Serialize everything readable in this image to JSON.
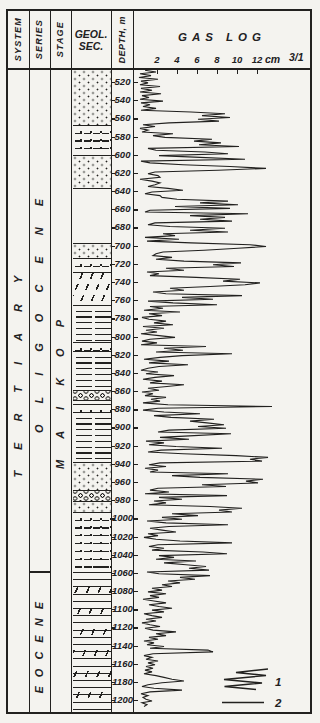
{
  "header": {
    "system_label": "SYSTEM",
    "series_label": "SERIES",
    "stage_label": "STAGE",
    "geol_sec_line1": "GEOL.",
    "geol_sec_line2": "SEC.",
    "depth_label": "DEPTH, m",
    "gas_log_title": "GAS LOG",
    "scale_unit": "cm",
    "scale_ratio": "3/1"
  },
  "stratigraphy": {
    "system": "TERTIARY",
    "series": [
      {
        "name": "OLIGOCENE",
        "depth_from": 520,
        "depth_to": 1060
      },
      {
        "name": "EOCENE",
        "depth_from": 1060,
        "depth_to": 1200
      }
    ],
    "stage": "MAIKOP"
  },
  "depth_axis": {
    "min": 520,
    "max": 1200,
    "step": 20,
    "labels": [
      520,
      540,
      560,
      580,
      600,
      620,
      640,
      660,
      680,
      700,
      720,
      740,
      760,
      780,
      800,
      820,
      840,
      860,
      880,
      900,
      920,
      940,
      960,
      980,
      1000,
      1020,
      1040,
      1060,
      1080,
      1100,
      1120,
      1140,
      1160,
      1180,
      1200
    ]
  },
  "gas_scale": {
    "ticks": [
      2,
      4,
      6,
      8,
      10,
      12
    ]
  },
  "lithology_bands": [
    {
      "depth_from": 507,
      "depth_to": 567,
      "pattern": "dots",
      "name": "sand-dots"
    },
    {
      "depth_from": 567,
      "depth_to": 600,
      "pattern": "dotdash",
      "name": "silty-sand"
    },
    {
      "depth_from": 600,
      "depth_to": 637,
      "pattern": "dots",
      "name": "sand-dots"
    },
    {
      "depth_from": 637,
      "depth_to": 697,
      "pattern": "blank",
      "name": "no-core"
    },
    {
      "depth_from": 697,
      "depth_to": 714,
      "pattern": "dots",
      "name": "sand-dots"
    },
    {
      "depth_from": 714,
      "depth_to": 729,
      "pattern": "dotdash",
      "name": "silty-sand"
    },
    {
      "depth_from": 729,
      "depth_to": 765,
      "pattern": "diag",
      "name": "marl-diagonal"
    },
    {
      "depth_from": 765,
      "depth_to": 806,
      "pattern": "hlines",
      "name": "clay-shale"
    },
    {
      "depth_from": 806,
      "depth_to": 816,
      "pattern": "dotdash",
      "name": "silt-interbed"
    },
    {
      "depth_from": 816,
      "depth_to": 859,
      "pattern": "hlines",
      "name": "clay-shale"
    },
    {
      "depth_from": 859,
      "depth_to": 870,
      "pattern": "pebbles",
      "name": "pebble-bed"
    },
    {
      "depth_from": 870,
      "depth_to": 874,
      "pattern": "hlines",
      "name": "clay-shale"
    },
    {
      "depth_from": 874,
      "depth_to": 883,
      "pattern": "dotdash",
      "name": "silt-interbed"
    },
    {
      "depth_from": 883,
      "depth_to": 938,
      "pattern": "hlines",
      "name": "clay-shale"
    },
    {
      "depth_from": 938,
      "depth_to": 969,
      "pattern": "dots",
      "name": "sand-dots"
    },
    {
      "depth_from": 969,
      "depth_to": 981,
      "pattern": "pebbles",
      "name": "pebble-bed"
    },
    {
      "depth_from": 981,
      "depth_to": 993,
      "pattern": "dots",
      "name": "sand-dots"
    },
    {
      "depth_from": 993,
      "depth_to": 1059,
      "pattern": "dotdash",
      "name": "alternating-silt-sand"
    },
    {
      "depth_from": 1059,
      "depth_to": 1213,
      "pattern": "diag2",
      "name": "shale-with-diagonal-partings"
    }
  ],
  "legend": {
    "items": [
      {
        "label": "1",
        "symbol": "zigzag-curve"
      },
      {
        "label": "2",
        "symbol": "straight-line"
      }
    ]
  },
  "chart_data": {
    "type": "line",
    "title": "GAS LOG",
    "xlabel": "gas reading, cm (scale 3/1)",
    "ylabel": "DEPTH, m",
    "xlim": [
      0,
      17
    ],
    "ylim": [
      520,
      1200
    ],
    "x_ticks": [
      2,
      4,
      6,
      8,
      10,
      12
    ],
    "legend_position": "bottom-right",
    "points": [
      [
        507,
        0.8
      ],
      [
        509,
        1.9
      ],
      [
        511,
        0.3
      ],
      [
        513,
        1.4
      ],
      [
        515,
        0.2
      ],
      [
        517,
        2.1
      ],
      [
        519,
        0.4
      ],
      [
        521,
        1.1
      ],
      [
        523,
        0.3
      ],
      [
        525,
        2.3
      ],
      [
        527,
        0.4
      ],
      [
        529,
        1.5
      ],
      [
        531,
        0.3
      ],
      [
        533,
        2.4
      ],
      [
        535,
        0.5
      ],
      [
        537,
        1.2
      ],
      [
        539,
        0.3
      ],
      [
        541,
        2.6
      ],
      [
        543,
        0.4
      ],
      [
        545,
        1.3
      ],
      [
        547,
        0.6
      ],
      [
        549,
        1.9
      ],
      [
        551,
        0.4
      ],
      [
        553,
        5.4
      ],
      [
        555,
        8.8
      ],
      [
        557,
        6.5
      ],
      [
        559,
        9.3
      ],
      [
        561,
        6.1
      ],
      [
        563,
        8.2
      ],
      [
        565,
        3.2
      ],
      [
        567,
        0.6
      ],
      [
        569,
        1.8
      ],
      [
        571,
        0.3
      ],
      [
        573,
        1.1
      ],
      [
        575,
        0.5
      ],
      [
        577,
        3.6
      ],
      [
        579,
        1.6
      ],
      [
        581,
        2.8
      ],
      [
        583,
        7.5
      ],
      [
        585,
        5.7
      ],
      [
        587,
        8.4
      ],
      [
        589,
        6.2
      ],
      [
        591,
        10.2
      ],
      [
        593,
        1.1
      ],
      [
        595,
        1.9
      ],
      [
        597,
        6.8
      ],
      [
        599,
        9.1
      ],
      [
        601,
        2.2
      ],
      [
        603,
        6.3
      ],
      [
        605,
        10.8
      ],
      [
        607,
        0.4
      ],
      [
        609,
        1.3
      ],
      [
        611,
        4.6
      ],
      [
        613,
        9.3
      ],
      [
        615,
        12.9
      ],
      [
        617,
        8.1
      ],
      [
        619,
        1.8
      ],
      [
        621,
        1.1
      ],
      [
        623,
        2.1
      ],
      [
        625,
        2.3
      ],
      [
        627,
        0.3
      ],
      [
        629,
        1.5
      ],
      [
        631,
        2.3
      ],
      [
        633,
        1.8
      ],
      [
        635,
        1.1
      ],
      [
        637,
        3.1
      ],
      [
        639,
        4.6
      ],
      [
        641,
        1.5
      ],
      [
        643,
        0.8
      ],
      [
        645,
        2.3
      ],
      [
        647,
        2.5
      ],
      [
        649,
        4.0
      ],
      [
        651,
        9.1
      ],
      [
        653,
        6.3
      ],
      [
        655,
        10.1
      ],
      [
        657,
        3.8
      ],
      [
        659,
        9.3
      ],
      [
        661,
        1.3
      ],
      [
        663,
        0.8
      ],
      [
        665,
        11.1
      ],
      [
        667,
        5.3
      ],
      [
        669,
        8.8
      ],
      [
        671,
        6.3
      ],
      [
        673,
        9.5
      ],
      [
        675,
        1.8
      ],
      [
        677,
        1.1
      ],
      [
        679,
        3.3
      ],
      [
        681,
        8.8
      ],
      [
        683,
        5.3
      ],
      [
        685,
        9.1
      ],
      [
        687,
        2.6
      ],
      [
        689,
        3.8
      ],
      [
        691,
        0.8
      ],
      [
        693,
        4.2
      ],
      [
        695,
        1.0
      ],
      [
        697,
        5.4
      ],
      [
        699,
        11.3
      ],
      [
        701,
        12.9
      ],
      [
        703,
        10.1
      ],
      [
        705,
        6.7
      ],
      [
        707,
        2.6
      ],
      [
        709,
        1.9
      ],
      [
        711,
        1.6
      ],
      [
        713,
        3.5
      ],
      [
        715,
        1.9
      ],
      [
        717,
        4.7
      ],
      [
        719,
        10.4
      ],
      [
        721,
        7.6
      ],
      [
        723,
        9.7
      ],
      [
        725,
        2.9
      ],
      [
        727,
        4.7
      ],
      [
        729,
        1.0
      ],
      [
        731,
        2.2
      ],
      [
        733,
        1.3
      ],
      [
        735,
        5.9
      ],
      [
        737,
        10.3
      ],
      [
        739,
        8.6
      ],
      [
        741,
        12.3
      ],
      [
        743,
        10.8
      ],
      [
        745,
        7.3
      ],
      [
        747,
        3.3
      ],
      [
        749,
        4.7
      ],
      [
        751,
        1.6
      ],
      [
        753,
        2.9
      ],
      [
        755,
        10.5
      ],
      [
        757,
        4.5
      ],
      [
        759,
        7.6
      ],
      [
        761,
        1.1
      ],
      [
        763,
        3.6
      ],
      [
        765,
        8.0
      ],
      [
        767,
        1.3
      ],
      [
        769,
        2.6
      ],
      [
        771,
        0.7
      ],
      [
        773,
        4.3
      ],
      [
        775,
        1.2
      ],
      [
        777,
        2.5
      ],
      [
        779,
        0.5
      ],
      [
        781,
        1.2
      ],
      [
        783,
        2.9
      ],
      [
        785,
        1.7
      ],
      [
        787,
        3.6
      ],
      [
        789,
        0.6
      ],
      [
        791,
        2.7
      ],
      [
        793,
        0.9
      ],
      [
        795,
        2.0
      ],
      [
        797,
        0.4
      ],
      [
        799,
        2.2
      ],
      [
        801,
        3.8
      ],
      [
        803,
        1.3
      ],
      [
        805,
        0.5
      ],
      [
        807,
        2.0
      ],
      [
        809,
        0.4
      ],
      [
        811,
        6.9
      ],
      [
        813,
        2.7
      ],
      [
        815,
        4.6
      ],
      [
        817,
        1.9
      ],
      [
        819,
        9.5
      ],
      [
        821,
        4.5
      ],
      [
        823,
        2.3
      ],
      [
        825,
        0.7
      ],
      [
        827,
        3.2
      ],
      [
        829,
        1.2
      ],
      [
        831,
        5.1
      ],
      [
        833,
        2.2
      ],
      [
        835,
        1.1
      ],
      [
        837,
        0.4
      ],
      [
        839,
        2.1
      ],
      [
        841,
        0.9
      ],
      [
        843,
        3.7
      ],
      [
        845,
        1.8
      ],
      [
        847,
        0.6
      ],
      [
        849,
        2.5
      ],
      [
        851,
        1.3
      ],
      [
        853,
        4.7
      ],
      [
        855,
        3.0
      ],
      [
        857,
        1.1
      ],
      [
        859,
        2.2
      ],
      [
        861,
        0.5
      ],
      [
        863,
        1.6
      ],
      [
        865,
        0.8
      ],
      [
        867,
        2.9
      ],
      [
        869,
        1.4
      ],
      [
        871,
        2.3
      ],
      [
        873,
        0.6
      ],
      [
        875,
        3.1
      ],
      [
        877,
        13.5
      ],
      [
        879,
        2.1
      ],
      [
        881,
        0.6
      ],
      [
        883,
        2.7
      ],
      [
        885,
        6.3
      ],
      [
        887,
        1.7
      ],
      [
        889,
        3.4
      ],
      [
        891,
        7.7
      ],
      [
        893,
        5.3
      ],
      [
        895,
        7.0
      ],
      [
        897,
        8.7
      ],
      [
        899,
        6.1
      ],
      [
        901,
        8.9
      ],
      [
        903,
        3.2
      ],
      [
        905,
        2.1
      ],
      [
        907,
        9.4
      ],
      [
        909,
        5.7
      ],
      [
        911,
        2.3
      ],
      [
        913,
        5.2
      ],
      [
        915,
        0.9
      ],
      [
        917,
        2.7
      ],
      [
        919,
        1.2
      ],
      [
        921,
        3.9
      ],
      [
        923,
        8.5
      ],
      [
        925,
        2.4
      ],
      [
        927,
        1.1
      ],
      [
        929,
        4.6
      ],
      [
        931,
        9.9
      ],
      [
        933,
        13.1
      ],
      [
        935,
        11.3
      ],
      [
        937,
        12.5
      ],
      [
        939,
        2.3
      ],
      [
        941,
        1.2
      ],
      [
        943,
        2.9
      ],
      [
        945,
        0.8
      ],
      [
        947,
        2.1
      ],
      [
        949,
        1.3
      ],
      [
        951,
        9.1
      ],
      [
        953,
        3.5
      ],
      [
        955,
        6.3
      ],
      [
        957,
        12.6
      ],
      [
        959,
        10.9
      ],
      [
        961,
        12.1
      ],
      [
        963,
        6.5
      ],
      [
        965,
        8.9
      ],
      [
        967,
        2.1
      ],
      [
        969,
        1.3
      ],
      [
        971,
        3.2
      ],
      [
        973,
        0.8
      ],
      [
        975,
        9.0
      ],
      [
        977,
        2.2
      ],
      [
        979,
        4.5
      ],
      [
        981,
        1.7
      ],
      [
        983,
        2.9
      ],
      [
        985,
        1.2
      ],
      [
        987,
        7.3
      ],
      [
        989,
        10.5
      ],
      [
        991,
        8.2
      ],
      [
        993,
        9.5
      ],
      [
        995,
        3.5
      ],
      [
        997,
        6.1
      ],
      [
        999,
        2.5
      ],
      [
        1001,
        4.5
      ],
      [
        1003,
        1.0
      ],
      [
        1005,
        2.9
      ],
      [
        1007,
        9.1
      ],
      [
        1009,
        3.2
      ],
      [
        1011,
        1.3
      ],
      [
        1013,
        2.5
      ],
      [
        1015,
        3.9
      ],
      [
        1017,
        1.1
      ],
      [
        1019,
        2.1
      ],
      [
        1021,
        0.7
      ],
      [
        1023,
        1.9
      ],
      [
        1025,
        4.3
      ],
      [
        1027,
        9.5
      ],
      [
        1029,
        2.1
      ],
      [
        1031,
        1.2
      ],
      [
        1033,
        2.7
      ],
      [
        1035,
        1.5
      ],
      [
        1037,
        6.6
      ],
      [
        1039,
        9.0
      ],
      [
        1041,
        2.2
      ],
      [
        1043,
        3.7
      ],
      [
        1045,
        1.9
      ],
      [
        1047,
        5.9
      ],
      [
        1049,
        2.7
      ],
      [
        1051,
        4.9
      ],
      [
        1053,
        6.9
      ],
      [
        1055,
        5.2
      ],
      [
        1057,
        7.2
      ],
      [
        1059,
        1.0
      ],
      [
        1061,
        2.2
      ],
      [
        1063,
        7.3
      ],
      [
        1065,
        4.3
      ],
      [
        1067,
        5.8
      ],
      [
        1069,
        3.1
      ],
      [
        1071,
        4.3
      ],
      [
        1073,
        2.5
      ],
      [
        1075,
        3.5
      ],
      [
        1077,
        1.5
      ],
      [
        1079,
        2.5
      ],
      [
        1081,
        1.1
      ],
      [
        1083,
        2.9
      ],
      [
        1085,
        1.3
      ],
      [
        1087,
        2.2
      ],
      [
        1089,
        0.6
      ],
      [
        1091,
        1.7
      ],
      [
        1093,
        2.9
      ],
      [
        1095,
        1.2
      ],
      [
        1097,
        2.2
      ],
      [
        1099,
        3.5
      ],
      [
        1101,
        1.5
      ],
      [
        1103,
        2.7
      ],
      [
        1105,
        0.7
      ],
      [
        1107,
        1.5
      ],
      [
        1109,
        2.5
      ],
      [
        1111,
        0.9
      ],
      [
        1113,
        1.9
      ],
      [
        1115,
        0.5
      ],
      [
        1117,
        1.3
      ],
      [
        1119,
        2.3
      ],
      [
        1121,
        0.8
      ],
      [
        1123,
        1.6
      ],
      [
        1125,
        3.9
      ],
      [
        1127,
        1.9
      ],
      [
        1129,
        2.9
      ],
      [
        1131,
        1.2
      ],
      [
        1133,
        2.1
      ],
      [
        1135,
        0.7
      ],
      [
        1137,
        1.7
      ],
      [
        1139,
        1.0
      ],
      [
        1141,
        2.7
      ],
      [
        1143,
        1.3
      ],
      [
        1145,
        7.1
      ],
      [
        1147,
        7.6
      ],
      [
        1149,
        1.6
      ],
      [
        1151,
        0.7
      ],
      [
        1153,
        1.5
      ],
      [
        1155,
        0.9
      ],
      [
        1157,
        2.1
      ],
      [
        1159,
        1.1
      ],
      [
        1161,
        1.8
      ],
      [
        1163,
        0.9
      ],
      [
        1165,
        1.6
      ],
      [
        1167,
        0.8
      ],
      [
        1169,
        1.5
      ],
      [
        1171,
        0.7
      ],
      [
        1173,
        1.9
      ],
      [
        1175,
        2.7
      ],
      [
        1177,
        3.5
      ],
      [
        1179,
        4.7
      ],
      [
        1181,
        2.5
      ],
      [
        1183,
        1.1
      ],
      [
        1185,
        0.5
      ],
      [
        1187,
        1.7
      ],
      [
        1189,
        4.5
      ],
      [
        1191,
        1.3
      ],
      [
        1193,
        0.4
      ],
      [
        1195,
        1.1
      ],
      [
        1197,
        0.6
      ],
      [
        1199,
        0.9
      ],
      [
        1201,
        1.5
      ],
      [
        1203,
        0.5
      ],
      [
        1205,
        1.0
      ],
      [
        1207,
        0.7
      ]
    ]
  },
  "colors": {
    "ink": "#22211f",
    "paper": "#f4f3ef"
  }
}
